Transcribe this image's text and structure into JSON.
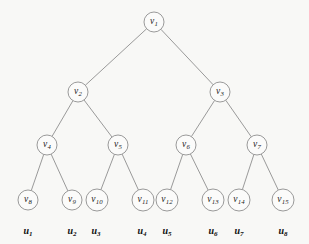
{
  "figure": {
    "type": "binary-tree-diagram",
    "title": "",
    "background_color": "#f8f8f6",
    "node_fill_color": "#fbfbfa",
    "node_stroke_color": "#8e8e8e",
    "text_color": "#1a1a1a",
    "width": 309,
    "height": 244
  },
  "nodes": [
    {
      "id": "v1",
      "name": "v",
      "sub": "1",
      "cx": 154,
      "cy": 22,
      "r": 10
    },
    {
      "id": "v2",
      "name": "v",
      "sub": "2",
      "cx": 78,
      "cy": 92,
      "r": 10
    },
    {
      "id": "v3",
      "name": "v",
      "sub": "3",
      "cx": 220,
      "cy": 92,
      "r": 10
    },
    {
      "id": "v4",
      "name": "v",
      "sub": "4",
      "cx": 47,
      "cy": 145,
      "r": 10
    },
    {
      "id": "v5",
      "name": "v",
      "sub": "5",
      "cx": 118,
      "cy": 145,
      "r": 10
    },
    {
      "id": "v6",
      "name": "v",
      "sub": "6",
      "cx": 186,
      "cy": 145,
      "r": 10
    },
    {
      "id": "v7",
      "name": "v",
      "sub": "7",
      "cx": 257,
      "cy": 145,
      "r": 10
    },
    {
      "id": "v8",
      "name": "v",
      "sub": "8",
      "cx": 28,
      "cy": 200,
      "r": 10
    },
    {
      "id": "v9",
      "name": "v",
      "sub": "9",
      "cx": 72,
      "cy": 200,
      "r": 10
    },
    {
      "id": "v10",
      "name": "v",
      "sub": "10",
      "cx": 97,
      "cy": 200,
      "r": 11
    },
    {
      "id": "v11",
      "name": "v",
      "sub": "11",
      "cx": 143,
      "cy": 200,
      "r": 11
    },
    {
      "id": "v12",
      "name": "v",
      "sub": "12",
      "cx": 167,
      "cy": 200,
      "r": 11
    },
    {
      "id": "v13",
      "name": "v",
      "sub": "13",
      "cx": 213,
      "cy": 200,
      "r": 11
    },
    {
      "id": "v14",
      "name": "v",
      "sub": "14",
      "cx": 239,
      "cy": 200,
      "r": 11
    },
    {
      "id": "v15",
      "name": "v",
      "sub": "15",
      "cx": 283,
      "cy": 200,
      "r": 11
    }
  ],
  "edges": [
    {
      "from": "v1",
      "to": "v2"
    },
    {
      "from": "v1",
      "to": "v3"
    },
    {
      "from": "v2",
      "to": "v4"
    },
    {
      "from": "v2",
      "to": "v5"
    },
    {
      "from": "v3",
      "to": "v6"
    },
    {
      "from": "v3",
      "to": "v7"
    },
    {
      "from": "v4",
      "to": "v8"
    },
    {
      "from": "v4",
      "to": "v9"
    },
    {
      "from": "v5",
      "to": "v10"
    },
    {
      "from": "v5",
      "to": "v11"
    },
    {
      "from": "v6",
      "to": "v12"
    },
    {
      "from": "v6",
      "to": "v13"
    },
    {
      "from": "v7",
      "to": "v14"
    },
    {
      "from": "v7",
      "to": "v15"
    }
  ],
  "leaf_labels": [
    {
      "id": "u1",
      "name": "u",
      "sub": "1",
      "x": 28,
      "y": 231
    },
    {
      "id": "u2",
      "name": "u",
      "sub": "2",
      "x": 72,
      "y": 231
    },
    {
      "id": "u3",
      "name": "u",
      "sub": "3",
      "x": 96,
      "y": 231
    },
    {
      "id": "u4",
      "name": "u",
      "sub": "4",
      "x": 142,
      "y": 231
    },
    {
      "id": "u5",
      "name": "u",
      "sub": "5",
      "x": 167,
      "y": 231
    },
    {
      "id": "u6",
      "name": "u",
      "sub": "6",
      "x": 213,
      "y": 231
    },
    {
      "id": "u7",
      "name": "u",
      "sub": "7",
      "x": 239,
      "y": 231
    },
    {
      "id": "u8",
      "name": "u",
      "sub": "8",
      "x": 283,
      "y": 231
    }
  ]
}
